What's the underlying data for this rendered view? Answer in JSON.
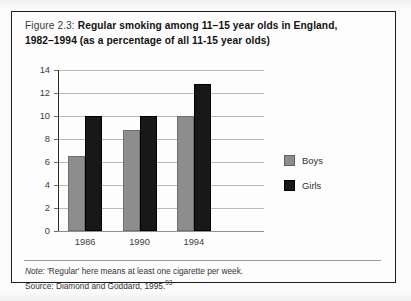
{
  "figure": {
    "label": "Figure 2.3:",
    "title_line1": "Regular smoking among 11–15 year olds in England,",
    "title_line2": "1982–1994 (as a percentage of all 11-15 year olds)"
  },
  "footnotes": {
    "note": "Note: 'Regular' here means at least one cigarette per week.",
    "note_lead": "Note:",
    "note_rest": " 'Regular' here means at least one cigarette per week.",
    "source_text": "Source: Diamond and Goddard, 1995.",
    "source_superscript": "93"
  },
  "legend": {
    "position": "right",
    "items": [
      {
        "label": "Boys",
        "color": "#8d8d8d"
      },
      {
        "label": "Girls",
        "color": "#181818"
      }
    ]
  },
  "colors": {
    "boys": "#8d8d8d",
    "girls": "#181818",
    "frame": "#1d1d1d",
    "gridline": "#b9b9b9",
    "page_background": "#fbfbfb"
  },
  "chart_data": {
    "type": "bar",
    "title": "Regular smoking among 11–15 year olds in England, 1982–1994 (as a percentage of all 11-15 year olds)",
    "xlabel": "",
    "ylabel": "",
    "categories": [
      "1986",
      "1990",
      "1994"
    ],
    "series": [
      {
        "name": "Boys",
        "color": "#8d8d8d",
        "values": [
          6.5,
          8.8,
          10.0
        ]
      },
      {
        "name": "Girls",
        "color": "#181818",
        "values": [
          10.0,
          10.0,
          12.8
        ]
      }
    ],
    "ylim": [
      0,
      14
    ],
    "yticks": [
      0,
      2,
      4,
      6,
      8,
      10,
      12,
      14
    ],
    "ytick_labels": [
      "0",
      "2",
      "4",
      "6",
      "8",
      "10",
      "12",
      "14"
    ],
    "grid": true,
    "legend_position": "right",
    "annotations": [
      "Note: 'Regular' here means at least one cigarette per week.",
      "Source: Diamond and Goddard, 1995.93"
    ]
  }
}
